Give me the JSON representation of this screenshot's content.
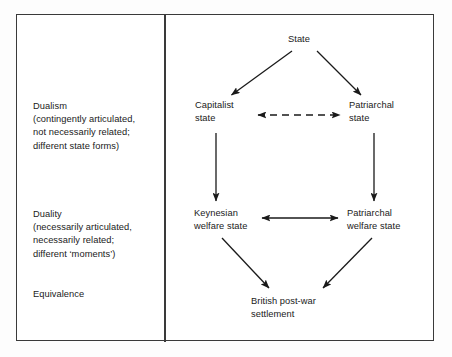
{
  "figure": {
    "type": "flow-diagram",
    "background_color": "#ffffff",
    "line_color": "#1a1a1a",
    "frame_color": "#3a3a3a"
  },
  "legend_panel": {
    "items": [
      {
        "name": "dualism",
        "text": "Dualism\n(contingently articulated,\nnot necessarily related;\ndifferent state forms)"
      },
      {
        "name": "duality",
        "text": "Duality\n(necessarily articulated,\nnecessarily related;\ndifferent ‘moments’)"
      },
      {
        "name": "equivalence",
        "text": "Equivalence"
      }
    ]
  },
  "diagram_panel": {
    "nodes": [
      {
        "id": "state",
        "label": "State"
      },
      {
        "id": "capitalist-state",
        "label": "Capitalist\nstate"
      },
      {
        "id": "patriarchal-state",
        "label": "Patriarchal\nstate"
      },
      {
        "id": "keynesian-welfare-state",
        "label": "Keynesian\nwelfare state"
      },
      {
        "id": "patriarchal-welfare-state",
        "label": "Patriarchal\nwelfare state"
      },
      {
        "id": "british-post-war-settlement",
        "label": "British post-war\nsettlement"
      }
    ],
    "edges": [
      {
        "from": "state",
        "to": "capitalist-state",
        "style": "solid",
        "direction": "one-way"
      },
      {
        "from": "state",
        "to": "patriarchal-state",
        "style": "solid",
        "direction": "one-way"
      },
      {
        "from": "capitalist-state",
        "to": "patriarchal-state",
        "style": "dashed",
        "direction": "two-way"
      },
      {
        "from": "capitalist-state",
        "to": "keynesian-welfare-state",
        "style": "solid",
        "direction": "one-way"
      },
      {
        "from": "patriarchal-state",
        "to": "patriarchal-welfare-state",
        "style": "solid",
        "direction": "one-way"
      },
      {
        "from": "keynesian-welfare-state",
        "to": "patriarchal-welfare-state",
        "style": "solid",
        "direction": "two-way"
      },
      {
        "from": "keynesian-welfare-state",
        "to": "british-post-war-settlement",
        "style": "solid",
        "direction": "one-way"
      },
      {
        "from": "patriarchal-welfare-state",
        "to": "british-post-war-settlement",
        "style": "solid",
        "direction": "one-way"
      }
    ]
  }
}
